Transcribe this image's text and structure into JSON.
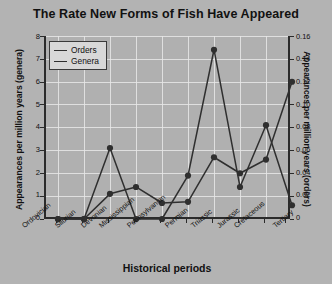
{
  "chart_data": {
    "type": "line",
    "title": "The Rate New Forms of Fish Have Appeared",
    "xlabel": "Historical periods",
    "ylabel": "Appearances per million years (genera)",
    "ylabel_right": "Appearances per million years (orders)",
    "grid": true,
    "legend_position": "top-left",
    "categories": [
      "Ordovician",
      "Silurian",
      "Devonian",
      "Mississippian",
      "Pennsylvanian",
      "Permian",
      "Triassic",
      "Jurassic",
      "Cretaceous",
      "Tertiary"
    ],
    "ylim": [
      0,
      8
    ],
    "yticks": [
      "0",
      "1",
      "2",
      "3",
      "4",
      "5",
      "6",
      "7",
      "8"
    ],
    "ylim_right": [
      0,
      0.16
    ],
    "yticks_right": [
      "0",
      "0.02",
      "0.04",
      "0.06",
      "0.08",
      "0.10",
      "0.12",
      "0.14",
      "0.16"
    ],
    "series": [
      {
        "name": "Orders",
        "axis": "right",
        "color": "#2f2f2f",
        "values": [
          0,
          0,
          3.1,
          0,
          0,
          1.9,
          7.4,
          1.4,
          4.1,
          0.6
        ],
        "values_right_axis": [
          0,
          0,
          0.062,
          0,
          0,
          0.038,
          0.148,
          0.028,
          0.082,
          0.012
        ]
      },
      {
        "name": "Genera",
        "axis": "left",
        "color": "#2f2f2f",
        "values": [
          0,
          0,
          1.1,
          1.4,
          0.7,
          0.75,
          2.7,
          2.0,
          2.6,
          6.0
        ]
      }
    ]
  },
  "legend": {
    "items": [
      {
        "label": "Orders"
      },
      {
        "label": "Genera"
      }
    ]
  },
  "colors": {
    "background": "#b3b3b3",
    "plot_background": "#b0b0b0",
    "grid": "#e8e8e8",
    "axis": "#2b2b2b",
    "line": "#2f2f2f",
    "text": "#111111",
    "legend_background": "#d8d8d8"
  }
}
